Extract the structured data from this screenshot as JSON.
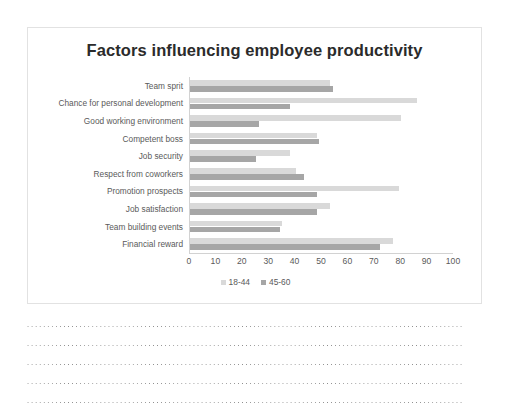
{
  "chart_data": {
    "type": "bar",
    "orientation": "horizontal",
    "title": "Factors influencing employee productivity",
    "xlabel": "",
    "ylabel": "",
    "xlim": [
      0,
      100
    ],
    "xticks": [
      0,
      10,
      20,
      30,
      40,
      50,
      60,
      70,
      80,
      90,
      100
    ],
    "xtick_labels": [
      "0",
      "10",
      "20",
      "30",
      "40",
      "50",
      "60",
      "70",
      "80",
      "90",
      "100"
    ],
    "grid": false,
    "legend_position": "bottom",
    "categories": [
      "Team sprit",
      "Chance for personal development",
      "Good working environment",
      "Competent boss",
      "Job security",
      "Respect from coworkers",
      "Promotion prospects",
      "Job satisfaction",
      "Team building events",
      "Financial reward"
    ],
    "series": [
      {
        "name": "18-44",
        "color": "#d9d9d9",
        "values": [
          53,
          86,
          80,
          48,
          38,
          40,
          79,
          53,
          35,
          77
        ]
      },
      {
        "name": "45-60",
        "color": "#a6a6a6",
        "values": [
          54,
          38,
          26,
          49,
          25,
          43,
          48,
          48,
          34,
          72
        ]
      }
    ]
  },
  "notes": {
    "ruled_line_count": 5
  }
}
